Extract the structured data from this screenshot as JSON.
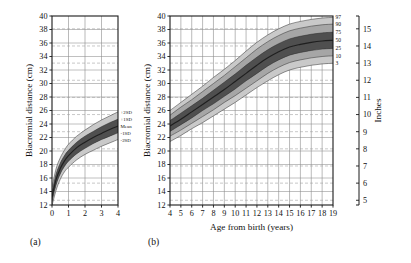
{
  "figure": {
    "panels": [
      {
        "id": "a",
        "label": "(a)"
      },
      {
        "id": "b",
        "label": "(b)"
      }
    ],
    "axis_titles": {
      "y_left": "Biacromial distance (cm)",
      "y_right": "Inches",
      "x": "Age from birth (years)"
    },
    "sd_labels": [
      "+2SD",
      "+1SD",
      "Mean",
      "-1SD",
      "-2SD"
    ],
    "percentile_labels": [
      "97",
      "90",
      "75",
      "50",
      "25",
      "10",
      "3"
    ],
    "colors": {
      "frame": "#1a1a1a",
      "grid": "#8c8c8c",
      "grid_dashed": "#9a9a9a",
      "band_outer": "#c9c9c9",
      "band_mid": "#a6a6a6",
      "band_inner": "#7d7d7d",
      "band_core": "#4f4f4f",
      "center_line": "#1f1f1f",
      "text": "#111111"
    }
  },
  "chart_data": [
    {
      "type": "area",
      "panel": "a",
      "title": "",
      "xlabel": "",
      "ylabel": "Biacromial distance (cm)",
      "xlim": [
        0,
        4
      ],
      "ylim": [
        12,
        40
      ],
      "xticks": [
        0,
        1,
        2,
        3,
        4
      ],
      "yticks": [
        12,
        14,
        16,
        18,
        20,
        22,
        24,
        26,
        28,
        30,
        32,
        34,
        36,
        38,
        40
      ],
      "grid": true,
      "inch_gridlines": [
        5,
        6,
        7,
        8,
        9,
        10,
        11,
        12,
        13,
        14,
        15
      ],
      "legend_position": "right-inside",
      "x": [
        0,
        0.25,
        0.5,
        0.75,
        1,
        1.5,
        2,
        2.5,
        3,
        3.5,
        4
      ],
      "series": [
        {
          "name": "+2SD",
          "values": [
            14.6,
            17.4,
            19.0,
            20.1,
            21.0,
            22.2,
            23.1,
            23.9,
            24.6,
            25.2,
            25.8
          ]
        },
        {
          "name": "+1SD",
          "values": [
            13.9,
            16.6,
            18.2,
            19.3,
            20.1,
            21.3,
            22.2,
            22.9,
            23.6,
            24.2,
            24.7
          ]
        },
        {
          "name": "Mean",
          "values": [
            13.2,
            15.8,
            17.4,
            18.5,
            19.3,
            20.5,
            21.3,
            22.0,
            22.6,
            23.2,
            23.7
          ]
        },
        {
          "name": "-1SD",
          "values": [
            12.5,
            15.0,
            16.6,
            17.7,
            18.5,
            19.6,
            20.4,
            21.1,
            21.7,
            22.2,
            22.7
          ]
        },
        {
          "name": "-2SD",
          "values": [
            11.9,
            14.2,
            15.8,
            16.9,
            17.6,
            18.7,
            19.5,
            20.1,
            20.7,
            21.2,
            21.7
          ]
        }
      ]
    },
    {
      "type": "area",
      "panel": "b",
      "title": "",
      "xlabel": "Age from birth (years)",
      "ylabel": "Biacromial distance (cm)",
      "ylabel_right": "Inches",
      "xlim": [
        4,
        19
      ],
      "ylim": [
        12,
        40
      ],
      "ylim_right": [
        5,
        15
      ],
      "xticks": [
        4,
        5,
        6,
        7,
        8,
        9,
        10,
        11,
        12,
        13,
        14,
        15,
        16,
        17,
        18,
        19
      ],
      "yticks": [
        12,
        14,
        16,
        18,
        20,
        22,
        24,
        26,
        28,
        30,
        32,
        34,
        36,
        38,
        40
      ],
      "yticks_right": [
        5,
        6,
        7,
        8,
        9,
        10,
        11,
        12,
        13,
        14,
        15
      ],
      "grid": true,
      "inch_gridlines": [
        5,
        6,
        7,
        8,
        9,
        10,
        11,
        12,
        13,
        14,
        15
      ],
      "legend_position": "right-inside",
      "x": [
        4,
        5,
        6,
        7,
        8,
        9,
        10,
        11,
        12,
        13,
        14,
        15,
        16,
        17,
        18,
        19
      ],
      "series": [
        {
          "name": "97",
          "values": [
            26.0,
            27.2,
            28.4,
            29.6,
            30.9,
            32.1,
            33.4,
            34.8,
            36.1,
            37.2,
            38.1,
            38.8,
            39.2,
            39.5,
            39.7,
            39.8
          ]
        },
        {
          "name": "90",
          "values": [
            25.3,
            26.5,
            27.6,
            28.8,
            30.0,
            31.2,
            32.5,
            33.8,
            35.1,
            36.2,
            37.1,
            37.8,
            38.2,
            38.5,
            38.7,
            38.8
          ]
        },
        {
          "name": "75",
          "values": [
            24.5,
            25.6,
            26.7,
            27.8,
            29.0,
            30.2,
            31.4,
            32.7,
            33.9,
            35.0,
            35.9,
            36.6,
            37.0,
            37.3,
            37.5,
            37.6
          ]
        },
        {
          "name": "50",
          "values": [
            23.7,
            24.7,
            25.8,
            26.9,
            28.0,
            29.1,
            30.3,
            31.5,
            32.7,
            33.8,
            34.7,
            35.4,
            35.8,
            36.1,
            36.3,
            36.4
          ]
        },
        {
          "name": "25",
          "values": [
            22.9,
            23.9,
            24.9,
            26.0,
            27.0,
            28.1,
            29.2,
            30.4,
            31.5,
            32.6,
            33.5,
            34.2,
            34.6,
            34.9,
            35.1,
            35.2
          ]
        },
        {
          "name": "10",
          "values": [
            22.2,
            23.1,
            24.1,
            25.1,
            26.1,
            27.2,
            28.2,
            29.3,
            30.4,
            31.5,
            32.4,
            33.1,
            33.5,
            33.8,
            34.0,
            34.1
          ]
        },
        {
          "name": "3",
          "values": [
            21.4,
            22.3,
            23.3,
            24.2,
            25.2,
            26.2,
            27.2,
            28.3,
            29.4,
            30.4,
            31.3,
            32.0,
            32.4,
            32.7,
            32.9,
            33.0
          ]
        }
      ]
    }
  ]
}
